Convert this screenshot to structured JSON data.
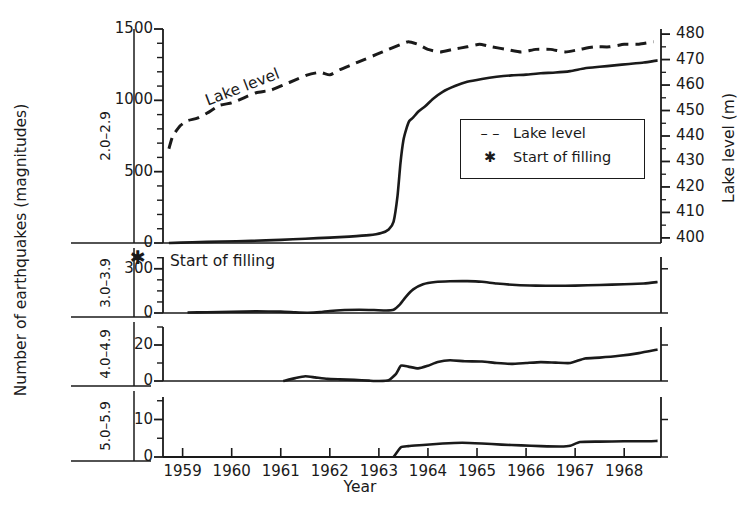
{
  "axes": {
    "ylabel_main": "Number of earthquakes (magnitudes)",
    "ylabel_right": "Lake level (m)",
    "xlabel": "Year"
  },
  "magnitude_bands": [
    {
      "label": "2.0–2.9"
    },
    {
      "label": "3.0–3.9"
    },
    {
      "label": "4.0–4.9"
    },
    {
      "label": "5.0–5.9"
    }
  ],
  "legend": {
    "items": [
      {
        "key": "– –",
        "label": "Lake level"
      },
      {
        "key": "✱",
        "label": "Start of filling"
      }
    ]
  },
  "annotations": {
    "start_of_filling": "Start of filling",
    "start_of_filling_marker": "✱",
    "lake_level_inline": "Lake level"
  },
  "chart_data": {
    "type": "line",
    "title": "",
    "xlabel": "Year",
    "ylabel": "Number of earthquakes (magnitudes)",
    "y2label": "Lake level (m)",
    "xlim": [
      1958.6,
      1968.75
    ],
    "xticks": [
      1959,
      1960,
      1961,
      1962,
      1963,
      1964,
      1965,
      1966,
      1967,
      1968
    ],
    "grid": false,
    "legend_position": "inside-right",
    "panels": [
      {
        "band": "2.0–2.9",
        "ylim": [
          0,
          1500
        ],
        "yticks": [
          0,
          500,
          1000,
          1500
        ],
        "minor_tick_step": 100,
        "y2lim": [
          398,
          482
        ],
        "y2ticks": [
          400,
          410,
          420,
          430,
          440,
          450,
          460,
          470,
          480
        ],
        "series": [
          {
            "name": "Lake level",
            "style": "dashed",
            "axis": "right",
            "x": [
              1958.72,
              1958.8,
              1958.95,
              1959.1,
              1959.3,
              1959.5,
              1959.75,
              1960.0,
              1960.25,
              1960.5,
              1960.8,
              1961.05,
              1961.3,
              1961.55,
              1961.8,
              1962.0,
              1962.2,
              1962.45,
              1962.7,
              1962.95,
              1963.2,
              1963.45,
              1963.6,
              1963.8,
              1964.0,
              1964.25,
              1964.5,
              1964.8,
              1965.05,
              1965.3,
              1965.6,
              1965.9,
              1966.2,
              1966.5,
              1966.8,
              1967.1,
              1967.4,
              1967.7,
              1968.0,
              1968.3,
              1968.6
            ],
            "values": [
              435,
              440,
              444,
              446,
              447,
              449,
              452,
              453,
              455,
              457,
              458,
              460,
              462,
              464,
              465,
              464,
              466,
              468,
              470,
              472,
              474,
              476,
              477,
              476,
              474,
              473,
              474,
              475,
              476,
              475,
              474,
              473,
              474,
              474,
              473,
              474,
              475,
              475,
              476,
              476,
              477
            ]
          },
          {
            "name": "Cumulative earthquakes 2.0-2.9",
            "style": "solid",
            "axis": "left",
            "x": [
              1958.72,
              1959.2,
              1959.8,
              1960.4,
              1961.0,
              1961.5,
              1962.0,
              1962.4,
              1962.8,
              1963.05,
              1963.2,
              1963.3,
              1963.38,
              1963.44,
              1963.5,
              1963.56,
              1963.62,
              1963.7,
              1963.8,
              1963.95,
              1964.1,
              1964.3,
              1964.55,
              1964.8,
              1965.1,
              1965.4,
              1965.7,
              1966.0,
              1966.3,
              1966.6,
              1966.9,
              1967.2,
              1967.5,
              1967.8,
              1968.1,
              1968.4,
              1968.68
            ],
            "values": [
              0,
              5,
              10,
              15,
              22,
              30,
              38,
              45,
              55,
              70,
              95,
              150,
              330,
              560,
              720,
              800,
              855,
              880,
              920,
              960,
              1010,
              1060,
              1100,
              1130,
              1150,
              1165,
              1175,
              1180,
              1190,
              1195,
              1205,
              1225,
              1235,
              1245,
              1255,
              1265,
              1280
            ]
          }
        ]
      },
      {
        "band": "3.0–3.9",
        "ylim": [
          0,
          380
        ],
        "yticks": [
          0,
          300
        ],
        "minor_tick_step": 75,
        "series": [
          {
            "name": "Cumulative earthquakes 3.0-3.9",
            "style": "solid",
            "axis": "left",
            "x": [
              1959.1,
              1959.5,
              1960.0,
              1960.5,
              1961.0,
              1961.3,
              1961.55,
              1961.8,
              1962.0,
              1962.3,
              1962.6,
              1962.9,
              1963.15,
              1963.3,
              1963.42,
              1963.55,
              1963.7,
              1963.9,
              1964.15,
              1964.45,
              1964.8,
              1965.1,
              1965.4,
              1965.8,
              1966.2,
              1966.6,
              1967.0,
              1967.5,
              1968.0,
              1968.4,
              1968.68
            ],
            "values": [
              3,
              5,
              8,
              11,
              9,
              4,
              2,
              6,
              14,
              20,
              22,
              20,
              17,
              22,
              55,
              110,
              160,
              195,
              210,
              215,
              216,
              212,
              200,
              190,
              186,
              185,
              186,
              190,
              195,
              200,
              210
            ]
          }
        ]
      },
      {
        "band": "4.0–4.9",
        "ylim": [
          0,
          30
        ],
        "yticks": [
          0,
          20
        ],
        "minor_tick_step": 10,
        "series": [
          {
            "name": "Cumulative earthquakes 4.0-4.9",
            "style": "solid",
            "axis": "left",
            "x": [
              1961.05,
              1961.3,
              1961.5,
              1961.7,
              1961.95,
              1962.2,
              1962.5,
              1962.8,
              1963.0,
              1963.2,
              1963.35,
              1963.45,
              1963.6,
              1963.8,
              1964.0,
              1964.2,
              1964.45,
              1964.75,
              1965.1,
              1965.4,
              1965.7,
              1966.0,
              1966.3,
              1966.6,
              1966.9,
              1967.2,
              1967.5,
              1967.9,
              1968.3,
              1968.68
            ],
            "values": [
              0,
              1.6,
              2.6,
              2.0,
              1.2,
              0.9,
              0.6,
              0.2,
              0.0,
              0.4,
              4.0,
              8.5,
              8.0,
              7.0,
              8.5,
              10.5,
              11.5,
              11.0,
              10.8,
              10.0,
              9.5,
              10.0,
              10.5,
              10.2,
              10.0,
              12.5,
              13.0,
              14.0,
              15.5,
              17.5
            ]
          }
        ]
      },
      {
        "band": "5.0–5.9",
        "ylim": [
          0,
          16
        ],
        "yticks": [
          0,
          10
        ],
        "minor_tick_step": 5,
        "series": [
          {
            "name": "Cumulative earthquakes 5.0-5.9",
            "style": "solid",
            "axis": "left",
            "x": [
              1963.3,
              1963.45,
              1963.6,
              1963.9,
              1964.3,
              1964.7,
              1965.1,
              1965.5,
              1965.9,
              1966.3,
              1966.7,
              1966.9,
              1967.1,
              1967.5,
              1968.0,
              1968.4,
              1968.68
            ],
            "values": [
              0,
              2.6,
              2.9,
              3.2,
              3.6,
              3.8,
              3.6,
              3.3,
              3.1,
              2.9,
              2.8,
              3.0,
              4.0,
              4.1,
              4.2,
              4.2,
              4.3
            ]
          }
        ]
      }
    ]
  },
  "colors": {
    "ink": "#1a1a1a",
    "background": "#ffffff"
  }
}
